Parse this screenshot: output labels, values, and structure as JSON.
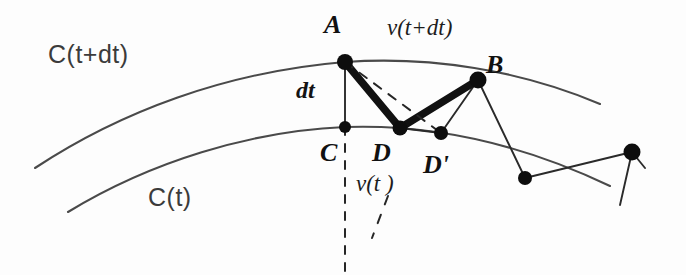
{
  "figure": {
    "background_color": "#fdfdfd",
    "ink_color": "#161616",
    "labels": {
      "curve_upper": "C(t+dt)",
      "curve_lower": "C(t)",
      "point_a": "A",
      "point_b": "B",
      "point_c": "C",
      "point_d": "D",
      "point_d_prime": "D'",
      "offset_dt": "dt",
      "velocity_t": "v(t )",
      "velocity_t_plus_dt": "v(t+dt)"
    },
    "geometry": {
      "curve_upper_path": "M 35 168 C 120 112, 225 72, 345 62 C 430 56, 520 70, 600 104",
      "curve_lower_path": "M 68 212 C 150 162, 250 131, 345 127 C 430 124, 520 143, 610 186",
      "points": [
        {
          "name": "A",
          "x": 345,
          "y": 62
        },
        {
          "name": "B",
          "x": 478,
          "y": 80
        },
        {
          "name": "C",
          "x": 345,
          "y": 127
        },
        {
          "name": "D",
          "x": 400,
          "y": 128
        },
        {
          "name": "D'",
          "x": 441,
          "y": 133
        },
        {
          "name": "E",
          "x": 525,
          "y": 178
        },
        {
          "name": "F",
          "x": 632,
          "y": 152
        }
      ],
      "thick_polyline": "M 345 62 L 400 128 L 478 80",
      "thin_segments": [
        "M 345 62 L 345 127",
        "M 400 128 L 441 133",
        "M 441 133 L 478 80",
        "M 478 80 L 525 178",
        "M 525 178 L 632 152",
        "M 632 152 L 645 168",
        "M 632 152 L 620 205",
        "M 478 80 L 600 104"
      ],
      "dashed_segments": [
        "M 345 62 L 441 133",
        "M 345 127 L 345 272",
        "M 388 196 L 372 238"
      ]
    }
  }
}
